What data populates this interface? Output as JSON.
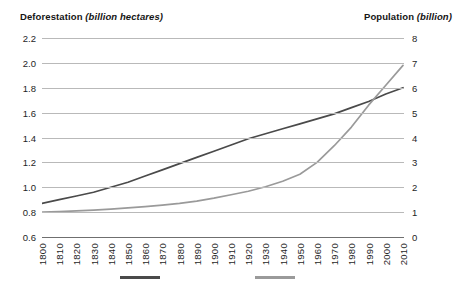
{
  "titles": {
    "left_name": "Deforestation",
    "left_unit": "(billion hectares)",
    "right_name": "Population",
    "right_unit": "(billion)"
  },
  "legend": {
    "items": [
      {
        "name": "deforestation-series",
        "label": "",
        "color": "#4a4a4a"
      },
      {
        "name": "population-series",
        "label": "",
        "color": "#9a9a9a"
      }
    ]
  },
  "colors": {
    "deforestation_line": "#4a4a4a",
    "population_line": "#9a9a9a",
    "gridline": "#b9b9b9",
    "axis": "#6f6f6f",
    "text": "#1e1e1e"
  },
  "chart_data": {
    "type": "line",
    "title": "",
    "xlabel": "",
    "grid": true,
    "legend_position": "bottom",
    "x": [
      1800,
      1810,
      1820,
      1830,
      1840,
      1850,
      1860,
      1870,
      1880,
      1890,
      1900,
      1910,
      1920,
      1930,
      1940,
      1950,
      1960,
      1970,
      1980,
      1990,
      2000,
      2010
    ],
    "xtick_labels": [
      "1800",
      "1810",
      "1820",
      "1830",
      "1840",
      "1850",
      "1860",
      "1870",
      "1880",
      "1890",
      "1900",
      "1910",
      "1920",
      "1930",
      "1940",
      "1950",
      "1960",
      "1970",
      "1980",
      "1990",
      "2000",
      "2010"
    ],
    "axes": [
      {
        "id": "left",
        "name": "Deforestation",
        "unit": "billion hectares",
        "ylim": [
          0.6,
          2.2
        ],
        "ytick_labels": [
          "2.2",
          "2.0",
          "1.8",
          "1.6",
          "1.4",
          "1.2",
          "1.0",
          "0.8",
          "0.6"
        ],
        "ytick_values": [
          2.2,
          2.0,
          1.8,
          1.6,
          1.4,
          1.2,
          1.0,
          0.8,
          0.6
        ]
      },
      {
        "id": "right",
        "name": "Population",
        "unit": "billion",
        "ylim": [
          0,
          8
        ],
        "ytick_labels": [
          "8",
          "7",
          "6",
          "5",
          "4",
          "3",
          "2",
          "1",
          "0"
        ],
        "ytick_values": [
          8,
          7,
          6,
          5,
          4,
          3,
          2,
          1,
          0
        ]
      }
    ],
    "series": [
      {
        "name": "Deforestation",
        "axis": "left",
        "color": "#4a4a4a",
        "unit": "billion hectares",
        "values": [
          0.87,
          0.9,
          0.93,
          0.96,
          1.0,
          1.04,
          1.09,
          1.14,
          1.19,
          1.24,
          1.29,
          1.34,
          1.39,
          1.43,
          1.47,
          1.51,
          1.55,
          1.59,
          1.64,
          1.69,
          1.75,
          1.8
        ]
      },
      {
        "name": "Population",
        "axis": "right",
        "color": "#9a9a9a",
        "unit": "billion",
        "values": [
          1.0,
          1.02,
          1.05,
          1.08,
          1.12,
          1.17,
          1.22,
          1.28,
          1.35,
          1.44,
          1.56,
          1.7,
          1.84,
          2.02,
          2.24,
          2.52,
          3.0,
          3.67,
          4.42,
          5.3,
          6.1,
          6.9
        ]
      }
    ]
  }
}
